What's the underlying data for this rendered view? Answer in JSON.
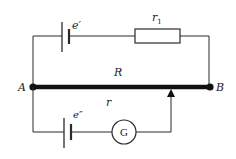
{
  "diagram": {
    "type": "circuit",
    "colors": {
      "wire": "#2a2a2a",
      "background": "#ffffff"
    },
    "labels": {
      "emf_top": "e′",
      "resistor_top": "r",
      "resistor_top_sub": "1",
      "slide_wire": "R",
      "node_left": "A",
      "node_right": "B",
      "emf_bottom": "e″",
      "internal_r": "r",
      "galvanometer": "G"
    }
  }
}
